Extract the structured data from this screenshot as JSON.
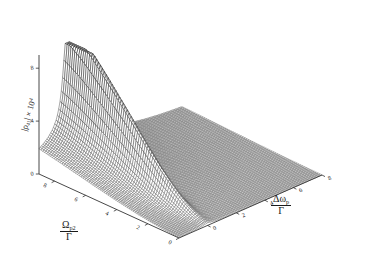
{
  "figure": {
    "type": "3d-surface-mesh-plot",
    "background_color": "#ffffff",
    "mesh_color": "#2b2b2b",
    "axis_color": "#333333"
  },
  "axes": {
    "x": {
      "label_numerator": "Δω",
      "label_subscript": "p",
      "label_denominator": "Γ",
      "ticks": [
        "0",
        "2",
        "4",
        "6",
        "8"
      ],
      "range": [
        -2,
        8
      ]
    },
    "y": {
      "label_numerator": "Ω",
      "label_subscript": "p2",
      "label_denominator": "Γ",
      "ticks": [
        "0",
        "2",
        "4",
        "6",
        "8"
      ],
      "range": [
        0,
        9
      ]
    },
    "z": {
      "label": "|ρ",
      "label_subscript": "41",
      "label_mid": "| × 10",
      "label_superscript": "4",
      "ticks": [
        "0",
        "4",
        "8"
      ],
      "range": [
        0,
        9
      ]
    }
  },
  "chart_data": {
    "type": "surface",
    "title": "",
    "xlabel": "Δωp/Γ",
    "ylabel": "Ωp2/Γ",
    "zlabel": "|ρ41| × 10^4",
    "xlim": [
      -2,
      8
    ],
    "ylim": [
      0,
      9
    ],
    "zlim": [
      0,
      9
    ],
    "xticks": [
      0,
      2,
      4,
      6,
      8
    ],
    "yticks": [
      0,
      2,
      4,
      6,
      8
    ],
    "zticks": [
      0,
      4,
      8
    ],
    "grid": false,
    "legend": "none",
    "peak": {
      "x": 0.0,
      "y": 9.0,
      "z": 9.0
    },
    "x_values": [
      -2.0,
      -1.6,
      -1.2,
      -0.8,
      -0.4,
      0.0,
      0.4,
      0.8,
      1.2,
      1.6,
      2.0,
      2.8,
      3.6,
      4.4,
      5.2,
      6.0,
      6.8,
      7.6,
      8.0
    ],
    "y_values": [
      0.0,
      0.5,
      1.0,
      1.5,
      2.0,
      2.5,
      3.0,
      3.5,
      4.0,
      4.5,
      5.0,
      5.5,
      6.0,
      6.5,
      7.0,
      7.5,
      8.0,
      8.5,
      9.0
    ],
    "z_peak_profile_over_y": [
      0.15,
      0.3,
      0.55,
      0.9,
      1.35,
      1.85,
      2.4,
      3.0,
      3.6,
      4.25,
      4.9,
      5.5,
      6.1,
      6.7,
      7.25,
      7.8,
      8.3,
      8.7,
      9.0
    ],
    "z_baseline_profile_over_y": [
      0.05,
      0.08,
      0.12,
      0.18,
      0.25,
      0.33,
      0.42,
      0.52,
      0.62,
      0.73,
      0.85,
      0.97,
      1.1,
      1.22,
      1.35,
      1.48,
      1.6,
      1.72,
      1.85
    ],
    "peak_halfwidth_x": 0.35
  }
}
